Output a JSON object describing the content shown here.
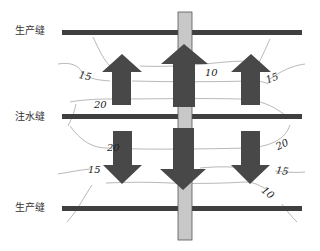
{
  "seams": {
    "top": {
      "label": "生产缝",
      "type": "production"
    },
    "middle": {
      "label": "注水缝",
      "type": "injection"
    },
    "bottom": {
      "label": "生产缝",
      "type": "production"
    }
  },
  "contours": {
    "top_left": "15",
    "top_mid_left": "20",
    "top_center": "10",
    "top_right": "15",
    "bottom_right_upper": "20",
    "bottom_left": "15",
    "bottom_right_mid": "15",
    "bottom_right_lower": "10",
    "bottom_left_upper": "20"
  },
  "arrows": {
    "upper": [
      "up-arrow",
      "up-arrow",
      "up-arrow"
    ],
    "lower": [
      "down-arrow",
      "down-arrow",
      "down-arrow"
    ]
  },
  "colors": {
    "seam_line": "#3f3f3f",
    "arrow": "#484848",
    "wellbore": "#c8c8c8",
    "contour": "#9a9a9a"
  }
}
